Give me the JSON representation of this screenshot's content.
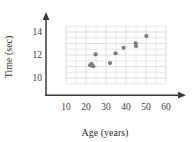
{
  "chart_data": {
    "type": "scatter",
    "title": "",
    "xlabel": "Age (years)",
    "ylabel": "Time (sec)",
    "xlim": [
      0,
      63
    ],
    "ylim": [
      8.6,
      14.9
    ],
    "xticks": [
      10,
      20,
      30,
      40,
      50,
      60
    ],
    "yticks": [
      10,
      12,
      14
    ],
    "xtick_labels": [
      "10",
      "20",
      "30",
      "40",
      "50",
      "60"
    ],
    "ytick_labels": [
      "10",
      "12",
      "14"
    ],
    "grid": true,
    "grid_color": "#d9d9e0",
    "grid_x_step": 5,
    "grid_y_step": 0.5,
    "grid_x_range": [
      10,
      60
    ],
    "grid_y_range": [
      9.5,
      14.5
    ],
    "legend": null,
    "legend_position": "none",
    "axis_color": "#3a3a3a",
    "marker_color": "#7b7b84",
    "marker_size": 4.2,
    "points": [
      {
        "x": 22.0,
        "y": 11.1
      },
      {
        "x": 22.8,
        "y": 11.22
      },
      {
        "x": 23.6,
        "y": 11.02
      },
      {
        "x": 24.8,
        "y": 12.05
      },
      {
        "x": 32.0,
        "y": 11.3
      },
      {
        "x": 34.8,
        "y": 12.15
      },
      {
        "x": 38.8,
        "y": 12.62
      },
      {
        "x": 44.8,
        "y": 13.02
      },
      {
        "x": 45.0,
        "y": 12.78
      },
      {
        "x": 50.2,
        "y": 13.65
      }
    ]
  },
  "axes": {
    "x_axis_name": "Age (years)",
    "y_axis_name": "Time (sec)"
  }
}
